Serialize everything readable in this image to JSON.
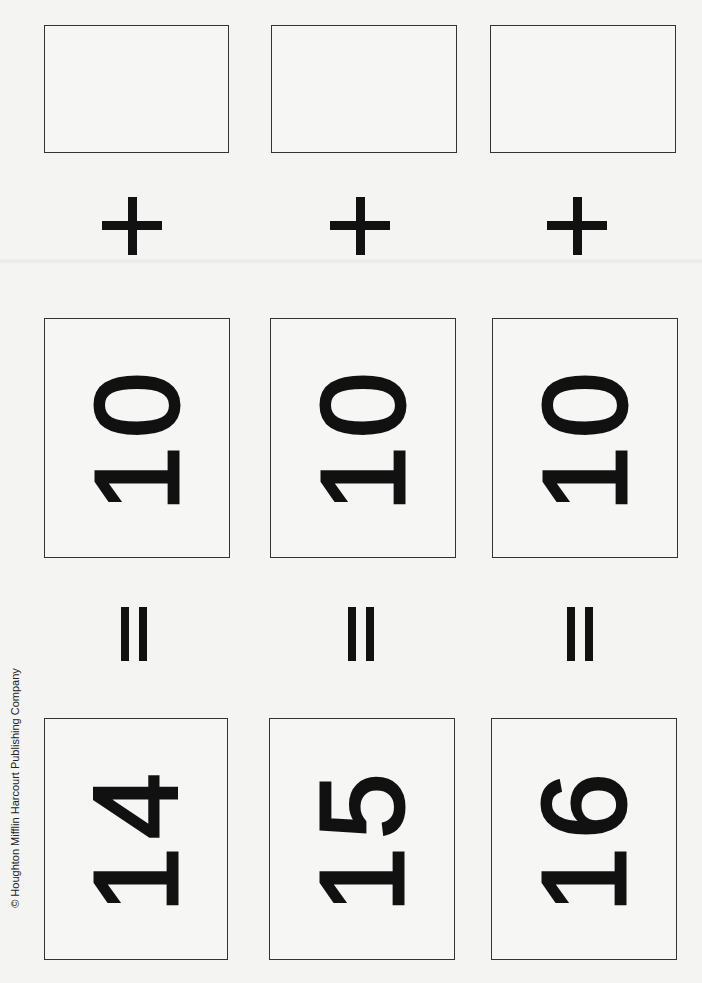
{
  "page": {
    "copyright": "© Houghton Mifflin Harcourt Publishing Company"
  },
  "symbols": {
    "plus": "+",
    "equals": "="
  },
  "columns": [
    {
      "answer": "",
      "addend": "10",
      "sum": "14"
    },
    {
      "answer": "",
      "addend": "10",
      "sum": "15"
    },
    {
      "answer": "",
      "addend": "10",
      "sum": "16"
    }
  ],
  "text_orientation": "rotated 90° counter-clockwise"
}
